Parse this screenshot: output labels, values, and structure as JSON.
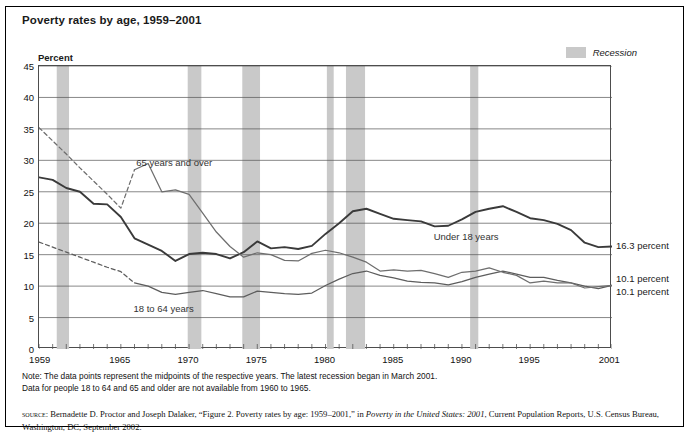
{
  "title": "Poverty rates by age, 1959–2001",
  "legend": {
    "label": "Recession",
    "swatch_color": "#c9c9c9"
  },
  "axis": {
    "ylabel": "Percent",
    "yticks": [
      "0",
      "5",
      "10",
      "15",
      "20",
      "25",
      "30",
      "35",
      "40",
      "45"
    ],
    "xticks": [
      "1959",
      "1965",
      "1970",
      "1975",
      "1980",
      "1985",
      "1990",
      "1995",
      "2001"
    ]
  },
  "series_labels": {
    "older": "65 years and over",
    "adults": "18 to 64 years",
    "children": "Under 18 years"
  },
  "end_labels": {
    "children": "16.3 percent",
    "adults": "10.1 percent",
    "older": "10.1 percent"
  },
  "notes": {
    "line1": "Note: The data points represent the midpoints of the respective years. The latest recession began in March 2001.",
    "line2": "Data for people 18 to 64 and 65 and older are not available from 1960 to 1965."
  },
  "source": {
    "prefix": "source:",
    "text1": " Bernadette D. Proctor and Joseph Dalaker, “Figure 2. Poverty rates by age: 1959–2001,” in ",
    "italic1": "Poverty in the United States: 2001",
    "text2": ", Current Population Reports, U.S. Census Bureau, Washington, DC, September 2002."
  },
  "chart_data": {
    "type": "line",
    "title": "Poverty rates by age, 1959–2001",
    "xlabel": "",
    "ylabel": "Percent",
    "xlim": [
      1959,
      2001
    ],
    "ylim": [
      0,
      45
    ],
    "grid": true,
    "legend_position": "top-right",
    "x": [
      1959,
      1960,
      1961,
      1962,
      1963,
      1964,
      1965,
      1966,
      1967,
      1968,
      1969,
      1970,
      1971,
      1972,
      1973,
      1974,
      1975,
      1976,
      1977,
      1978,
      1979,
      1980,
      1981,
      1982,
      1983,
      1984,
      1985,
      1986,
      1987,
      1988,
      1989,
      1990,
      1991,
      1992,
      1993,
      1994,
      1995,
      1996,
      1997,
      1998,
      1999,
      2000,
      2001
    ],
    "series": [
      {
        "name": "Under 18 years",
        "color": "#3a3a3a",
        "end_label": "16.3 percent",
        "values": [
          27.3,
          26.9,
          25.6,
          25.0,
          23.1,
          23.0,
          21.0,
          17.6,
          16.6,
          15.6,
          14.0,
          15.1,
          15.3,
          15.1,
          14.4,
          15.4,
          17.1,
          16.0,
          16.2,
          15.9,
          16.4,
          18.3,
          20.0,
          21.9,
          22.3,
          21.5,
          20.7,
          20.5,
          20.3,
          19.5,
          19.6,
          20.6,
          21.8,
          22.3,
          22.7,
          21.8,
          20.8,
          20.5,
          19.9,
          18.9,
          16.9,
          16.2,
          16.3
        ]
      },
      {
        "name": "18 to 64 years",
        "color": "#5d5d5d",
        "end_label": "10.1 percent",
        "dashed_from": 1959,
        "dashed_to": 1966,
        "values": [
          17.0,
          16.2,
          15.4,
          14.6,
          13.8,
          13.0,
          12.3,
          10.5,
          10.0,
          9.0,
          8.7,
          9.0,
          9.3,
          8.8,
          8.3,
          8.3,
          9.2,
          9.0,
          8.8,
          8.7,
          8.9,
          10.1,
          11.1,
          12.0,
          12.4,
          11.7,
          11.3,
          10.8,
          10.6,
          10.5,
          10.2,
          10.7,
          11.4,
          11.9,
          12.4,
          11.9,
          11.4,
          11.4,
          10.9,
          10.5,
          10.0,
          9.6,
          10.1
        ]
      },
      {
        "name": "65 years and over",
        "color": "#6e6e6e",
        "end_label": "10.1 percent",
        "dashed_from": 1959,
        "dashed_to": 1966,
        "values": [
          35.2,
          33.1,
          31.0,
          28.8,
          26.7,
          24.6,
          22.4,
          28.5,
          29.5,
          25.0,
          25.3,
          24.6,
          21.6,
          18.6,
          16.3,
          14.6,
          15.3,
          15.0,
          14.1,
          14.0,
          15.2,
          15.7,
          15.3,
          14.6,
          13.8,
          12.4,
          12.6,
          12.4,
          12.5,
          12.0,
          11.4,
          12.2,
          12.4,
          12.9,
          12.2,
          11.7,
          10.5,
          10.8,
          10.5,
          10.5,
          9.7,
          9.9,
          10.1
        ]
      }
    ],
    "recessions": [
      {
        "start": 1960.3,
        "end": 1961.2
      },
      {
        "start": 1969.9,
        "end": 1970.9
      },
      {
        "start": 1973.9,
        "end": 1975.2
      },
      {
        "start": 1980.1,
        "end": 1980.6
      },
      {
        "start": 1981.5,
        "end": 1982.9
      },
      {
        "start": 1990.6,
        "end": 1991.2
      },
      {
        "start": 2001.2,
        "end": 2001.6
      }
    ]
  }
}
